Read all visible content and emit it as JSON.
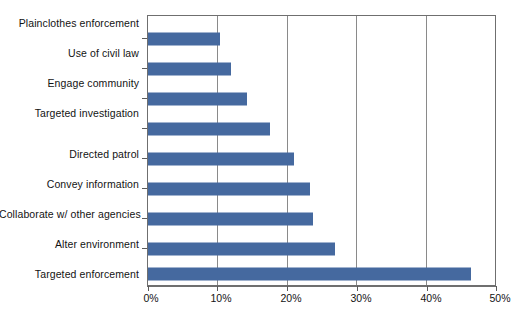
{
  "chart_data": {
    "type": "bar",
    "orientation": "horizontal",
    "title": "",
    "xlabel": "",
    "ylabel": "",
    "xlim": [
      0,
      50
    ],
    "xticks": [
      0,
      10,
      20,
      30,
      40,
      50
    ],
    "xtick_labels": [
      "0%",
      "10%",
      "20%",
      "30%",
      "40%",
      "50%"
    ],
    "grid": "vertical",
    "legend": "none",
    "bar_color": "#45699f",
    "categories": [
      "Plainclothes enforcement",
      "Use of civil law",
      "Engage community",
      "Targeted investigation",
      "Directed patrol",
      "Convey information",
      "Collaborate w/ other agencies",
      "Alter environment",
      "Targeted enforcement"
    ],
    "values": [
      10.4,
      12.0,
      14.3,
      17.6,
      21.0,
      23.4,
      23.8,
      27.0,
      46.6
    ],
    "value_labels": [
      "10.4%",
      "12.0%",
      "14.3%",
      "17.6%",
      "21.0%",
      "23.4%",
      "23.8%",
      "27.0%",
      "46.6%"
    ]
  },
  "colors": {
    "bar": "#45699f",
    "gridline": "#8a8a8a",
    "axis": "#6f6f6f",
    "text": "#131313",
    "background": "#ffffff"
  }
}
